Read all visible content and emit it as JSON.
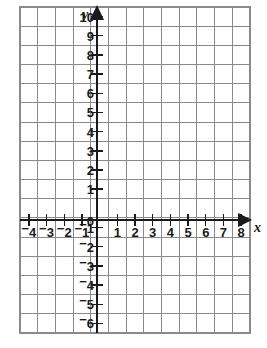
{
  "figure": {
    "kind": "cartesian-coordinate-grid",
    "background_color": "#ffffff",
    "grid_color": "#8a8a8a",
    "axis_color": "#1a1a1a"
  },
  "axes": {
    "x_axis_label": "x",
    "y_axis_label": "y",
    "origin_label": "0",
    "x_arrow": "arrow-right",
    "y_arrow": "arrow-up"
  },
  "chart_data": {
    "type": "scatter",
    "title": "",
    "xlabel": "x",
    "ylabel": "y",
    "grid": true,
    "legend": false,
    "series": [],
    "x": [],
    "y": [],
    "xlim": [
      -4.5,
      8.5
    ],
    "ylim": [
      -6.5,
      10.5
    ],
    "x_tick_values": [
      -4,
      -3,
      -2,
      -1,
      1,
      2,
      3,
      4,
      5,
      6,
      7,
      8
    ],
    "y_tick_values": [
      10,
      9,
      8,
      7,
      6,
      5,
      4,
      3,
      2,
      1,
      -1,
      -2,
      -3,
      -4,
      -5,
      -6
    ],
    "x_tick_labels": [
      "⁻4",
      "⁻3",
      "⁻2",
      "⁻1",
      "1",
      "2",
      "3",
      "4",
      "5",
      "6",
      "7",
      "8"
    ],
    "y_tick_labels": [
      "10",
      "9",
      "8",
      "7",
      "6",
      "5",
      "4",
      "3",
      "2",
      "1",
      "⁻1",
      "⁻2",
      "⁻3",
      "⁻4",
      "⁻5",
      "⁻6"
    ],
    "origin_tick_label": "0",
    "x_grid_minmax": [
      -4.5,
      8.5
    ],
    "y_grid_minmax": [
      -6.5,
      10.5
    ]
  },
  "ticks": {
    "x_negative": [
      {
        "value": -4,
        "sign": "−",
        "digits": "4"
      },
      {
        "value": -3,
        "sign": "−",
        "digits": "3"
      },
      {
        "value": -2,
        "sign": "−",
        "digits": "2"
      },
      {
        "value": -1,
        "sign": "−",
        "digits": "1"
      }
    ],
    "x_positive": [
      {
        "value": 1,
        "digits": "1"
      },
      {
        "value": 2,
        "digits": "2"
      },
      {
        "value": 3,
        "digits": "3"
      },
      {
        "value": 4,
        "digits": "4"
      },
      {
        "value": 5,
        "digits": "5"
      },
      {
        "value": 6,
        "digits": "6"
      },
      {
        "value": 7,
        "digits": "7"
      },
      {
        "value": 8,
        "digits": "8"
      }
    ],
    "y_positive": [
      {
        "value": 10,
        "digits": "10"
      },
      {
        "value": 9,
        "digits": "9"
      },
      {
        "value": 8,
        "digits": "8"
      },
      {
        "value": 7,
        "digits": "7"
      },
      {
        "value": 6,
        "digits": "6"
      },
      {
        "value": 5,
        "digits": "5"
      },
      {
        "value": 4,
        "digits": "4"
      },
      {
        "value": 3,
        "digits": "3"
      },
      {
        "value": 2,
        "digits": "2"
      },
      {
        "value": 1,
        "digits": "1"
      }
    ],
    "y_negative": [
      {
        "value": -1,
        "sign": "−",
        "digits": "1"
      },
      {
        "value": -2,
        "sign": "−",
        "digits": "2"
      },
      {
        "value": -3,
        "sign": "−",
        "digits": "3"
      },
      {
        "value": -4,
        "sign": "−",
        "digits": "4"
      },
      {
        "value": -5,
        "sign": "−",
        "digits": "5"
      },
      {
        "value": -6,
        "sign": "−",
        "digits": "6"
      }
    ]
  }
}
